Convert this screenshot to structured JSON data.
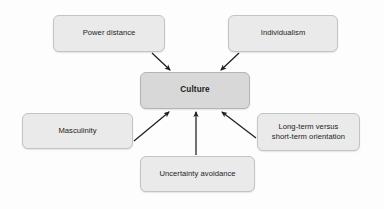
{
  "diagram": {
    "background_color": "#fdfdfd",
    "center": {
      "id": "culture",
      "label": "Culture",
      "fill_color": "#d8d8d8",
      "border_color": "#b4b4b4",
      "x": 140,
      "y": 72,
      "width": 110,
      "height": 37
    },
    "nodes": [
      {
        "id": "power-distance",
        "label": "Power distance",
        "fill_color": "#eaeaea",
        "border_color": "#c3c3c3",
        "x": 53,
        "y": 15,
        "width": 112,
        "height": 37
      },
      {
        "id": "individualism",
        "label": "Individualism",
        "fill_color": "#eaeaea",
        "border_color": "#c3c3c3",
        "x": 228,
        "y": 15,
        "width": 110,
        "height": 37
      },
      {
        "id": "masculinity",
        "label": "Masculinity",
        "fill_color": "#eaeaea",
        "border_color": "#c3c3c3",
        "x": 22,
        "y": 113,
        "width": 111,
        "height": 36
      },
      {
        "id": "long-term-versus-short-term-orientation",
        "label": "Long-term versus\nshort-term orientation",
        "fill_color": "#eaeaea",
        "border_color": "#c3c3c3",
        "x": 257,
        "y": 113,
        "width": 103,
        "height": 38
      },
      {
        "id": "uncertainty-avoidance",
        "label": "Uncertainty avoidance",
        "fill_color": "#eaeaea",
        "border_color": "#c3c3c3",
        "x": 140,
        "y": 156,
        "width": 115,
        "height": 36
      }
    ],
    "arrows": [
      {
        "id": "power-distance-to-culture",
        "from": "power-distance",
        "to": "culture",
        "x1": 152,
        "y1": 53,
        "x2": 170,
        "y2": 70,
        "color": "#1f1f1f"
      },
      {
        "id": "individualism-to-culture",
        "from": "individualism",
        "to": "culture",
        "x1": 239,
        "y1": 53,
        "x2": 221,
        "y2": 70,
        "color": "#1f1f1f"
      },
      {
        "id": "masculinity-to-culture",
        "from": "masculinity",
        "to": "culture",
        "x1": 134,
        "y1": 141,
        "x2": 169,
        "y2": 112,
        "color": "#1f1f1f"
      },
      {
        "id": "uncertainty-avoidance-to-culture",
        "from": "uncertainty-avoidance",
        "to": "culture",
        "x1": 196,
        "y1": 155,
        "x2": 196,
        "y2": 112,
        "color": "#1f1f1f"
      },
      {
        "id": "long-term-orientation-to-culture",
        "from": "long-term-versus-short-term-orientation",
        "to": "culture",
        "x1": 256,
        "y1": 138,
        "x2": 222,
        "y2": 112,
        "color": "#1f1f1f"
      }
    ]
  }
}
